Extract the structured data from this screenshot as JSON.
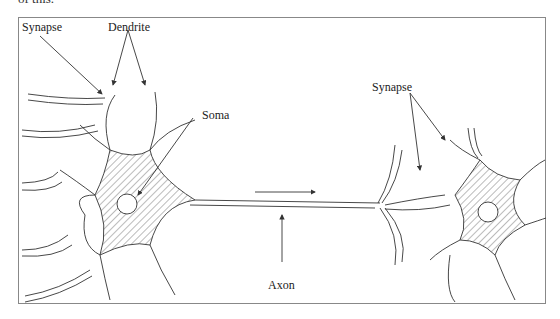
{
  "figure": {
    "cropped_caption": "of this.",
    "labels": {
      "synapse_left": "Synapse",
      "dendrite": "Dendrite",
      "soma": "Soma",
      "synapse_right": "Synapse",
      "axon": "Axon"
    }
  }
}
